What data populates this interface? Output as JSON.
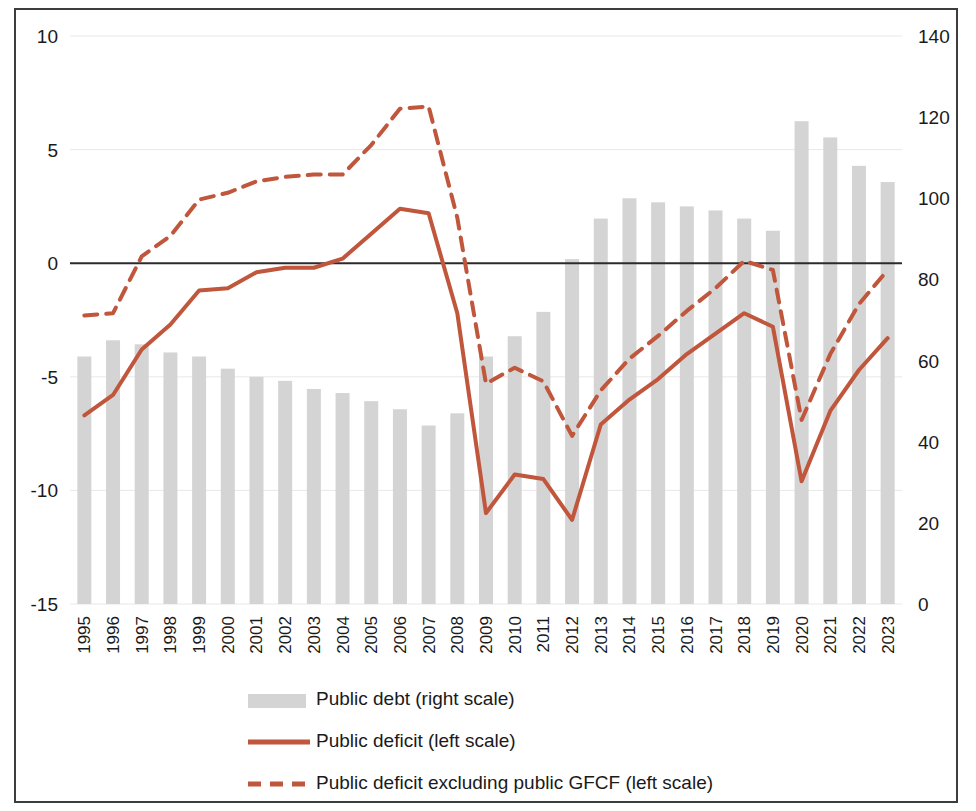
{
  "chart_data": {
    "type": "bar",
    "title": "",
    "subtitle": "",
    "xlabel": "",
    "ylabel": "",
    "categories": [
      "1995",
      "1996",
      "1997",
      "1998",
      "1999",
      "2000",
      "2001",
      "2002",
      "2003",
      "2004",
      "2005",
      "2006",
      "2007",
      "2008",
      "2009",
      "2010",
      "2011",
      "2012",
      "2013",
      "2014",
      "2015",
      "2016",
      "2017",
      "2018",
      "2019",
      "2020",
      "2021",
      "2022",
      "2023"
    ],
    "left_axis": {
      "ticks": [
        "10",
        "5",
        "0",
        "-5",
        "-10",
        "-15"
      ],
      "values": [
        10,
        5,
        0,
        -5,
        -10,
        -15
      ],
      "ylim": [
        -15,
        10
      ],
      "position": "left"
    },
    "right_axis": {
      "ticks": [
        "140",
        "120",
        "100",
        "80",
        "60",
        "40",
        "20",
        "0"
      ],
      "values": [
        140,
        120,
        100,
        80,
        60,
        40,
        20,
        0
      ],
      "ylim": [
        0,
        140
      ],
      "position": "right"
    },
    "grid": true,
    "legend_position": "bottom",
    "colors": {
      "bar": "#d4d4d4",
      "line": "#c0563c",
      "dashed": "#c0563c",
      "zero_line": "#2b2b2b",
      "gridline": "#e8e8e8",
      "border": "#3d3d3d",
      "text": "#1a1a1a"
    },
    "series": [
      {
        "name": "Public debt (right scale)",
        "type": "bar",
        "axis": "right",
        "values": [
          61,
          65,
          64,
          62,
          61,
          58,
          56,
          55,
          53,
          52,
          50,
          48,
          44,
          47,
          61,
          66,
          72,
          85,
          95,
          100,
          99,
          98,
          97,
          95,
          92,
          119,
          115,
          108,
          104
        ]
      },
      {
        "name": "Public deficit (left scale)",
        "type": "line",
        "style": "solid",
        "axis": "left",
        "values": [
          -6.7,
          -5.8,
          -3.8,
          -2.7,
          -1.2,
          -1.1,
          -0.4,
          -0.2,
          -0.2,
          0.2,
          1.3,
          2.4,
          2.2,
          -2.2,
          -11.0,
          -9.3,
          -9.5,
          -11.3,
          -7.1,
          -6.0,
          -5.1,
          -4.0,
          -3.1,
          -2.2,
          -2.8,
          -9.6,
          -6.5,
          -4.7,
          -3.3
        ]
      },
      {
        "name": "Public deficit excluding public GFCF (left scale)",
        "type": "line",
        "style": "dashed",
        "axis": "left",
        "values": [
          -2.3,
          -2.2,
          0.3,
          1.2,
          2.8,
          3.1,
          3.6,
          3.8,
          3.9,
          3.9,
          5.2,
          6.8,
          6.9,
          2.0,
          -5.3,
          -4.6,
          -5.2,
          -7.6,
          -5.6,
          -4.2,
          -3.2,
          -2.1,
          -1.1,
          0.1,
          -0.3,
          -6.9,
          -4.0,
          -1.8,
          -0.3
        ]
      }
    ],
    "legend": [
      {
        "label": "Public debt (right scale)",
        "marker": "bar-swatch"
      },
      {
        "label": "Public deficit (left scale)",
        "marker": "solid-line"
      },
      {
        "label": "Public deficit excluding public GFCF (left scale)",
        "marker": "dashed-line"
      }
    ]
  }
}
